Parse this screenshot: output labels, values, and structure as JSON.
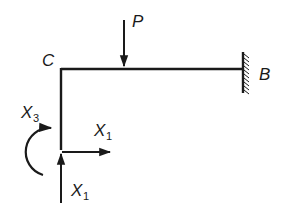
{
  "diagram": {
    "type": "structural-frame",
    "colors": {
      "line": "#1a1a1a",
      "background": "#ffffff"
    },
    "nodes": {
      "C": {
        "label": "C"
      },
      "B": {
        "label": "B",
        "support": "fixed-wall"
      }
    },
    "loads": {
      "P": {
        "label": "P",
        "direction": "down"
      }
    },
    "redundants": {
      "x1_horizontal": {
        "label": "X",
        "subscript": "1",
        "direction": "right"
      },
      "x1_vertical": {
        "label": "X",
        "subscript": "1",
        "direction": "up"
      },
      "x3_moment": {
        "label": "X",
        "subscript": "3",
        "direction": "clockwise"
      }
    }
  }
}
